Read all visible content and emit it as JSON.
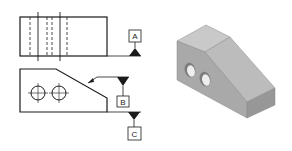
{
  "figure": {
    "colors": {
      "line": "#1a1a1a",
      "background": "#ffffff",
      "face_top": "#c9c9c9",
      "face_slope": "#bcbcbc",
      "face_front": "#a9a9a9",
      "face_end": "#979797",
      "hole": "#f0f0f0"
    },
    "datums": [
      {
        "id": "A",
        "label": "A",
        "feature": "bottom of top view"
      },
      {
        "id": "B",
        "label": "B",
        "feature": "inclined surface"
      },
      {
        "id": "C",
        "label": "C",
        "feature": "right end surface"
      }
    ],
    "views": {
      "top_view": "top orthographic view with hidden holes",
      "front_view": "front orthographic view with two holes",
      "isometric": "isometric shaded block with two holes"
    }
  }
}
